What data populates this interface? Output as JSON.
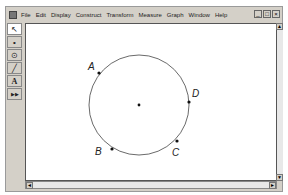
{
  "menubar": {
    "items": [
      "File",
      "Edit",
      "Display",
      "Construct",
      "Transform",
      "Measure",
      "Graph",
      "Window",
      "Help"
    ]
  },
  "window_controls": {
    "minimize": "_",
    "maximize": "□",
    "close": "×"
  },
  "toolbar": {
    "tools": [
      {
        "name": "arrow-tool",
        "glyph": "↖"
      },
      {
        "name": "point-tool",
        "glyph": "•"
      },
      {
        "name": "compass-tool",
        "glyph": "⊙"
      },
      {
        "name": "straightedge-tool",
        "glyph": "╱"
      },
      {
        "name": "text-tool",
        "glyph": "A"
      },
      {
        "name": "custom-tool",
        "glyph": "▶▶"
      }
    ]
  },
  "sketch": {
    "circle": {
      "cx": 139,
      "cy": 105,
      "r": 50
    },
    "center_point": {
      "x": 139,
      "y": 105
    },
    "points": [
      {
        "label": "A",
        "x": 99,
        "y": 73,
        "lx": 88,
        "ly": 70
      },
      {
        "label": "D",
        "x": 189,
        "y": 102,
        "lx": 192,
        "ly": 97
      },
      {
        "label": "B",
        "x": 112,
        "y": 149,
        "lx": 95,
        "ly": 155
      },
      {
        "label": "C",
        "x": 177,
        "y": 141,
        "lx": 172,
        "ly": 156
      }
    ]
  },
  "scrollbars": {
    "left_arrow": "◄",
    "right_arrow": "►",
    "up_arrow": "▲",
    "down_arrow": "▼"
  }
}
